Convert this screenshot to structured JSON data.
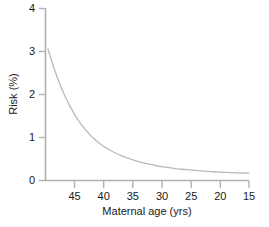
{
  "chart_data": {
    "type": "line",
    "title": "",
    "xlabel": "Maternal age (yrs)",
    "ylabel": "Risk (%)",
    "xlim": [
      49,
      15
    ],
    "ylim": [
      0,
      4
    ],
    "x_reversed": true,
    "grid": false,
    "legend": null,
    "xticks": [
      45,
      40,
      35,
      30,
      25,
      20,
      15
    ],
    "xtick_labels": [
      "45",
      "40",
      "35",
      "30",
      "25",
      "20",
      "15"
    ],
    "yticks": [
      0,
      1,
      2,
      3,
      4
    ],
    "ytick_labels": [
      "0",
      "1",
      "2",
      "3",
      "4"
    ],
    "series": [
      {
        "name": "Risk",
        "color": "#b9b9b9",
        "x": [
          48.5,
          48,
          47.5,
          47,
          46.5,
          46,
          45.5,
          45,
          44.5,
          44,
          43.5,
          43,
          42.5,
          42,
          41.5,
          41,
          40.5,
          40,
          39,
          38,
          37,
          36,
          35,
          34,
          33,
          32,
          31,
          30,
          29,
          28,
          27,
          26,
          25,
          24,
          23,
          22,
          21,
          20,
          19,
          18,
          17,
          16,
          15
        ],
        "y": [
          3.05,
          2.82,
          2.6,
          2.4,
          2.22,
          2.05,
          1.9,
          1.76,
          1.63,
          1.51,
          1.4,
          1.3,
          1.21,
          1.13,
          1.05,
          0.98,
          0.92,
          0.86,
          0.76,
          0.68,
          0.61,
          0.55,
          0.5,
          0.45,
          0.41,
          0.38,
          0.35,
          0.32,
          0.3,
          0.28,
          0.26,
          0.25,
          0.235,
          0.222,
          0.21,
          0.2,
          0.192,
          0.184,
          0.178,
          0.172,
          0.167,
          0.163,
          0.16
        ]
      }
    ],
    "axis_color": "#b0b0b0",
    "background": "#ffffff"
  }
}
